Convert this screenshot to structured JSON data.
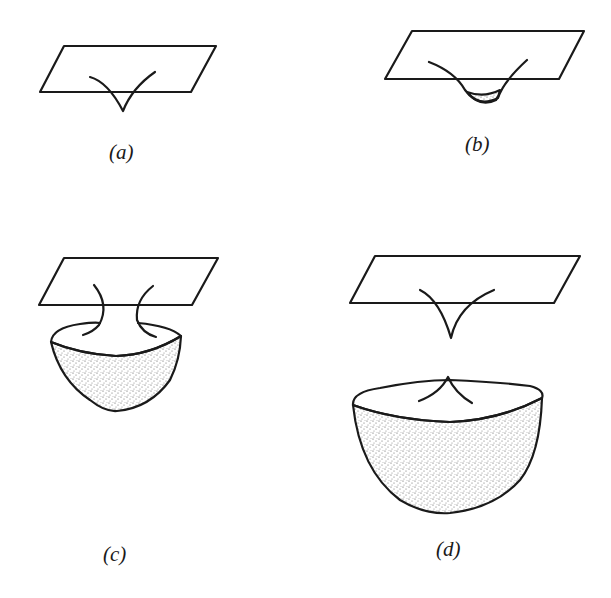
{
  "figure": {
    "panels": [
      {
        "id": "a",
        "caption": "(a)",
        "description": "cusp-shaped curve poking below a plane"
      },
      {
        "id": "b",
        "caption": "(b)",
        "description": "curve dipping below plane with a small shaded cap"
      },
      {
        "id": "c",
        "caption": "(c)",
        "description": "two arcs connecting plane to a shaded bowl below"
      },
      {
        "id": "d",
        "caption": "(d)",
        "description": "cusp below plane separated from a larger shaded bowl with upward cusp"
      }
    ],
    "stroke_color": "#1a1a1a",
    "fill_color": "#c8c8c8"
  }
}
